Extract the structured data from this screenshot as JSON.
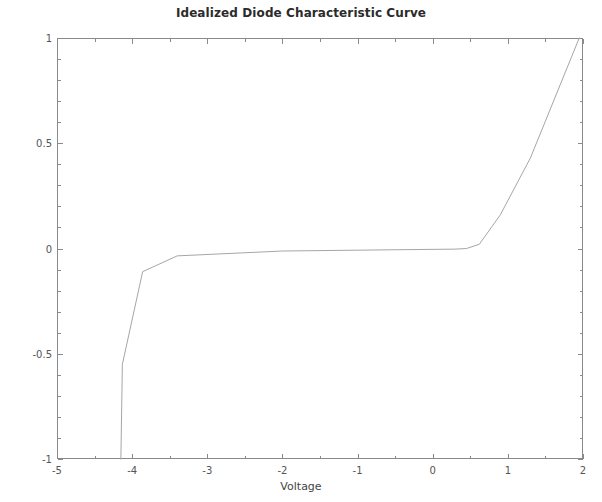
{
  "chart_data": {
    "type": "line",
    "title": "Idealized Diode Characteristic Curve",
    "xlabel": "Voltage",
    "ylabel": "Current",
    "xlim": [
      -5,
      2
    ],
    "ylim": [
      -1,
      1
    ],
    "grid": false,
    "legend": false,
    "xticks": [
      -5,
      -4,
      -3,
      -2,
      -1,
      0,
      1,
      2
    ],
    "xtick_labels": [
      "-5",
      "-4",
      "-3",
      "-2",
      "-1",
      "0",
      "1",
      "2"
    ],
    "yticks": [
      -1,
      -0.5,
      0,
      0.5,
      1
    ],
    "ytick_labels": [
      "-1",
      "-0.5",
      "0",
      "0.5",
      "1"
    ],
    "xminor_step": 0.5,
    "yminor_step": 0.1,
    "line_color": "#9a9a9a",
    "axis_color": "#7a7a7a",
    "background": "#ffffff",
    "series": [
      {
        "name": "Diode I-V",
        "x": [
          -4.15,
          -4.13,
          -3.86,
          -3.4,
          -2.0,
          -0.5,
          0.3,
          0.45,
          0.62,
          0.9,
          1.3,
          1.95
        ],
        "y": [
          -1.0,
          -0.55,
          -0.11,
          -0.035,
          -0.012,
          -0.006,
          -0.003,
          0.0,
          0.02,
          0.16,
          0.43,
          1.0
        ]
      }
    ],
    "annotations": {
      "breakdown_voltage": -4.15,
      "forward_turn_on_voltage": 0.45,
      "saturation_current": 0.0
    }
  },
  "figure": {
    "width": 602,
    "height": 502
  }
}
